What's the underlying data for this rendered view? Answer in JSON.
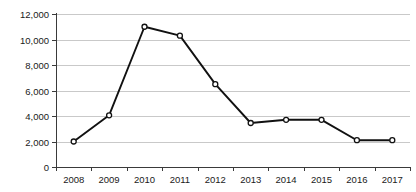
{
  "chart_data": {
    "type": "line",
    "title": "",
    "subtitle": "",
    "xlabel": "",
    "ylabel": "",
    "categories": [
      "2008",
      "2009",
      "2010",
      "2011",
      "2012",
      "2013",
      "2014",
      "2015",
      "2016",
      "2017"
    ],
    "values": [
      2000,
      4050,
      11000,
      10300,
      6500,
      3450,
      3700,
      3700,
      2100,
      2100
    ],
    "series": [
      {
        "name": "",
        "values": [
          2000,
          4050,
          11000,
          10300,
          6500,
          3450,
          3700,
          3700,
          2100,
          2100
        ]
      }
    ],
    "ylim": [
      0,
      12000
    ],
    "ytick_values": [
      0,
      2000,
      4000,
      6000,
      8000,
      10000,
      12000
    ],
    "ytick_labels": [
      "0",
      "2,000",
      "4,000",
      "6,000",
      "8,000",
      "10,000",
      "12,000"
    ],
    "xtick_labels": [
      "2008",
      "2009",
      "2010",
      "2011",
      "2012",
      "2013",
      "2014",
      "2015",
      "2016",
      "2017"
    ],
    "grid": true,
    "grid_axis": "y",
    "legend": false,
    "legend_position": "none",
    "marker": "circle",
    "line_color": "#111111",
    "marker_fill": "#ffffff",
    "marker_stroke": "#111111",
    "grid_color": "#c9c9c9",
    "axis_color": "#3a3a3a",
    "background_color": "#ffffff",
    "annotations": []
  },
  "layout": {
    "plot_left": 56,
    "plot_right": 410,
    "plot_top": 14,
    "plot_bottom": 167,
    "width": 416,
    "height": 192
  }
}
